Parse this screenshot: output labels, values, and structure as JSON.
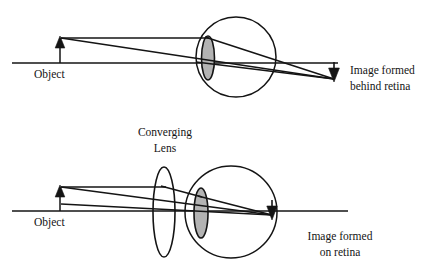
{
  "figure": {
    "title_semantic": "ray-diagram-hyperopia-correction",
    "width": 424,
    "height": 277,
    "background_color": "#ffffff",
    "stroke_color": "#141414",
    "lens_fill_color": "#b3b3b3"
  },
  "top_diagram": {
    "name": "uncorrected-eye",
    "object_label": "Object",
    "image_label_line1": "Image formed",
    "image_label_line2": "behind retina",
    "axis": {
      "x1": 12,
      "x2": 338,
      "y": 63
    },
    "object_arrow": {
      "x": 60,
      "base_y": 63,
      "tip_y": 37
    },
    "image_arrow": {
      "x": 334,
      "base_y": 63,
      "tip_y": 81
    },
    "eyeball": {
      "cx": 236,
      "cy": 57,
      "r": 40
    },
    "eye_lens": {
      "cx": 208,
      "cy": 58,
      "rx": 6.5,
      "ry": 22
    },
    "rays": [
      {
        "name": "parallel-ray",
        "x1": 61,
        "y1": 38,
        "x2": 208,
        "y2": 38
      },
      {
        "name": "parallel-ray-refracted",
        "x1": 208,
        "y1": 38,
        "x2": 334,
        "y2": 79
      },
      {
        "name": "chief-ray",
        "x1": 61,
        "y1": 38,
        "x2": 334,
        "y2": 79
      },
      {
        "name": "chief-ray-extension",
        "x1": 208,
        "y1": 63,
        "x2": 334,
        "y2": 62
      }
    ]
  },
  "bottom_diagram": {
    "name": "eye-with-converging-lens",
    "object_label": "Object",
    "lens_label_line1": "Converging",
    "lens_label_line2": "Lens",
    "image_label_line1": "Image formed",
    "image_label_line2": "on retina",
    "axis": {
      "x1": 12,
      "x2": 348,
      "y": 211
    },
    "object_arrow": {
      "x": 60,
      "base_y": 211,
      "tip_y": 186
    },
    "image_arrow": {
      "x": 272,
      "base_y": 200,
      "tip_y": 219
    },
    "eyeball": {
      "cx": 231,
      "cy": 212,
      "r": 46
    },
    "eye_lens": {
      "cx": 201,
      "cy": 213,
      "rx": 7,
      "ry": 25
    },
    "converging_lens": {
      "cx": 164,
      "cy": 212,
      "rx": 11,
      "ry": 45
    },
    "rays": [
      {
        "name": "parallel-ray",
        "x1": 61,
        "y1": 186,
        "x2": 164,
        "y2": 186
      },
      {
        "name": "parallel-ray-refracted-by-lens",
        "x1": 164,
        "y1": 186,
        "x2": 201,
        "y2": 196
      },
      {
        "name": "parallel-ray-refracted-by-eye",
        "x1": 201,
        "y1": 196,
        "x2": 272,
        "y2": 216
      },
      {
        "name": "chief-ray",
        "x1": 61,
        "y1": 186,
        "x2": 272,
        "y2": 216
      },
      {
        "name": "lower-ray",
        "x1": 61,
        "y1": 205,
        "x2": 272,
        "y2": 216
      }
    ]
  },
  "labels": {
    "object_top": {
      "x": 34,
      "y": 78
    },
    "object_bottom": {
      "x": 34,
      "y": 226
    },
    "image_top": {
      "x": 352,
      "y": 76
    },
    "image_bottom": {
      "x": 340,
      "y": 240
    },
    "converging_lens": {
      "x": 164,
      "y": 137
    }
  }
}
